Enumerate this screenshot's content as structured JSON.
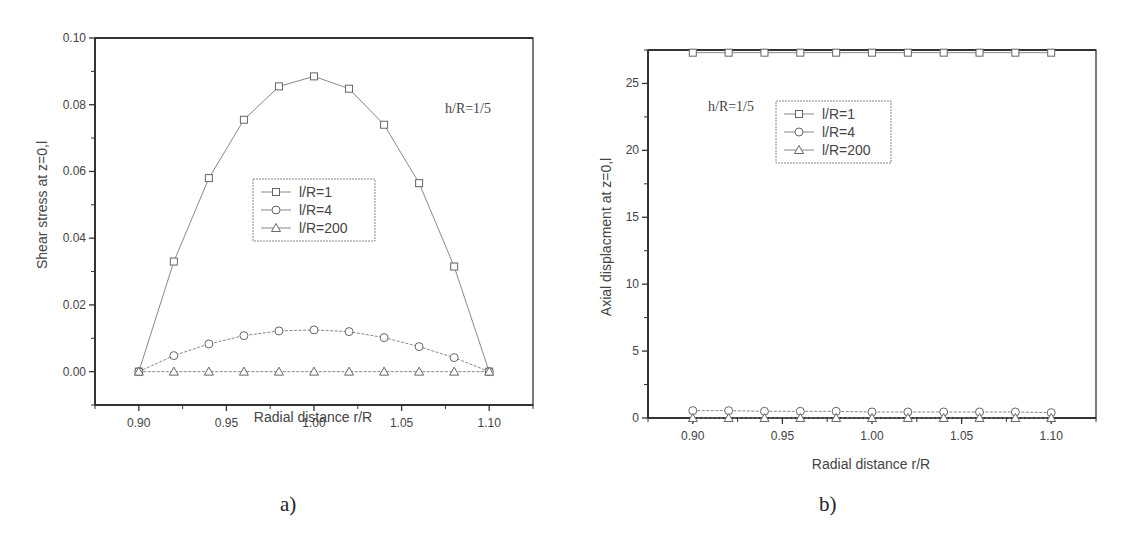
{
  "chart_data": [
    {
      "type": "line",
      "panel_label": "a)",
      "title": "",
      "annotation": "h/R=1/5",
      "xlabel": "Radial distance r/R",
      "ylabel": "Shear stress at z=0,l",
      "xlim": [
        0.875,
        1.125
      ],
      "ylim": [
        -0.01,
        0.1
      ],
      "x_ticks": [
        "0.90",
        "0.95",
        "1.00",
        "1.05",
        "1.10"
      ],
      "y_ticks": [
        "0.00",
        "0.02",
        "0.04",
        "0.06",
        "0.08",
        "0.10"
      ],
      "grid": false,
      "legend_position": "center",
      "x": [
        0.9,
        0.92,
        0.94,
        0.96,
        0.98,
        1.0,
        1.02,
        1.04,
        1.06,
        1.08,
        1.1
      ],
      "series": [
        {
          "name": "l/R=1",
          "marker": "square",
          "values": [
            0.0,
            0.033,
            0.058,
            0.0755,
            0.0855,
            0.0885,
            0.0848,
            0.074,
            0.0565,
            0.0315,
            0.0
          ]
        },
        {
          "name": "l/R=4",
          "marker": "circle",
          "values": [
            0.0,
            0.0048,
            0.0083,
            0.0108,
            0.0122,
            0.0125,
            0.012,
            0.0102,
            0.0075,
            0.0042,
            0.0
          ]
        },
        {
          "name": "l/R=200",
          "marker": "triangle",
          "values": [
            0.0,
            0.0,
            0.0,
            0.0,
            0.0,
            0.0,
            0.0,
            0.0,
            0.0,
            0.0,
            0.0
          ]
        }
      ]
    },
    {
      "type": "line",
      "panel_label": "b)",
      "title": "",
      "annotation": "h/R=1/5",
      "xlabel": "Radial distance r/R",
      "ylabel": "Axial displacment at z=0,l",
      "xlim": [
        0.875,
        1.125
      ],
      "ylim": [
        0,
        27.5
      ],
      "x_ticks": [
        "0.90",
        "0.95",
        "1.00",
        "1.05",
        "1.10"
      ],
      "y_ticks": [
        "0",
        "5",
        "10",
        "15",
        "20",
        "25"
      ],
      "grid": false,
      "legend_position": "upper right",
      "x": [
        0.9,
        0.92,
        0.94,
        0.96,
        0.98,
        1.0,
        1.02,
        1.04,
        1.06,
        1.08,
        1.1
      ],
      "series": [
        {
          "name": "l/R=1",
          "marker": "square",
          "values": [
            27.3,
            27.3,
            27.3,
            27.3,
            27.3,
            27.3,
            27.3,
            27.3,
            27.3,
            27.3,
            27.3
          ]
        },
        {
          "name": "l/R=4",
          "marker": "circle",
          "values": [
            0.55,
            0.55,
            0.5,
            0.5,
            0.5,
            0.45,
            0.45,
            0.45,
            0.45,
            0.45,
            0.4
          ]
        },
        {
          "name": "l/R=200",
          "marker": "triangle",
          "values": [
            0.0,
            0.0,
            0.0,
            0.0,
            0.0,
            0.0,
            0.0,
            0.0,
            0.0,
            0.0,
            0.0
          ]
        }
      ]
    }
  ],
  "captions": {
    "a": "a)",
    "b": "b)"
  }
}
